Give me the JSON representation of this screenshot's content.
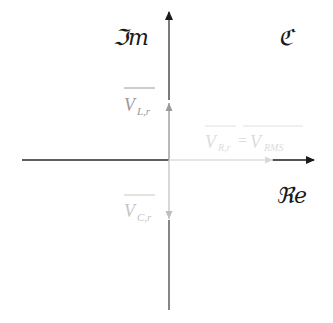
{
  "diagram": {
    "plane_label": "ℭ",
    "axes": {
      "imaginary": {
        "label": "ℑm"
      },
      "real": {
        "label": "ℜe"
      }
    },
    "phasors": [
      {
        "id": "V_L_r",
        "label_main": "V",
        "label_sub": "L,r",
        "direction": "up",
        "color": "#9a9a9a"
      },
      {
        "id": "V_R_r",
        "label_main": "V",
        "label_sub": "R,r",
        "label_eq": "=",
        "label_main2": "V",
        "label_sub2": "RMS",
        "direction": "right",
        "color": "#dcdcdc"
      },
      {
        "id": "V_C_r",
        "label_main": "V",
        "label_sub": "C,r",
        "direction": "down",
        "color": "#c4c4c4"
      }
    ],
    "colors": {
      "axis": "#2a2a2a",
      "background": "#ffffff"
    }
  }
}
